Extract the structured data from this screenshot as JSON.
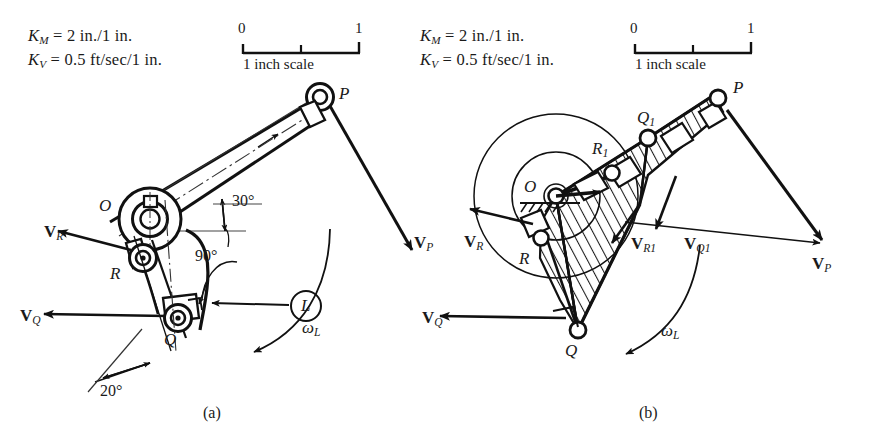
{
  "figure": {
    "caption_a": "(a)",
    "caption_b": "(b)"
  },
  "legend_a": {
    "km_sym": "K",
    "km_sub": "M",
    "km_value": "= 2 in./1 in.",
    "kv_sym": "K",
    "kv_sub": "V",
    "kv_value": "= 0.5 ft/sec/1 in."
  },
  "legend_b": {
    "km_sym": "K",
    "km_sub": "M",
    "km_value": "= 2 in./1 in.",
    "kv_sym": "K",
    "kv_sub": "V",
    "kv_value": "= 0.5 ft/sec/1 in."
  },
  "scale_a": {
    "left_tick": "0",
    "right_tick": "1",
    "caption": "1 inch scale"
  },
  "scale_b": {
    "left_tick": "0",
    "right_tick": "1",
    "caption": "1 inch scale"
  },
  "diagram_a": {
    "points": [
      {
        "name": "O",
        "label": "O"
      },
      {
        "name": "P",
        "label": "P"
      },
      {
        "name": "R",
        "label": "R"
      },
      {
        "name": "Q",
        "label": "Q"
      }
    ],
    "vectors": [
      {
        "name": "VR",
        "sym": "V",
        "sub": "R"
      },
      {
        "name": "VQ",
        "sym": "V",
        "sub": "Q"
      },
      {
        "name": "VP",
        "sym": "V",
        "sub": "P"
      }
    ],
    "angles": [
      {
        "name": "angle-30",
        "label": "30°"
      },
      {
        "name": "angle-90",
        "label": "90°"
      },
      {
        "name": "angle-20",
        "label": "20°"
      }
    ],
    "link_balloon": "L",
    "omega": {
      "sym": "ω",
      "sub": "L"
    }
  },
  "diagram_b": {
    "points": [
      {
        "name": "O",
        "label": "O"
      },
      {
        "name": "P",
        "label": "P"
      },
      {
        "name": "Q1",
        "label": "Q",
        "sub": "1"
      },
      {
        "name": "R1",
        "label": "R",
        "sub": "1"
      },
      {
        "name": "R",
        "label": "R"
      },
      {
        "name": "Q",
        "label": "Q"
      }
    ],
    "vectors": [
      {
        "name": "VR",
        "sym": "V",
        "sub": "R"
      },
      {
        "name": "VQ",
        "sym": "V",
        "sub": "Q"
      },
      {
        "name": "VR1",
        "sym": "V",
        "sub": "R",
        "sub2": "1"
      },
      {
        "name": "VQ1",
        "sym": "V",
        "sub": "Q",
        "sub2": "1"
      },
      {
        "name": "VP",
        "sym": "V",
        "sub": "P"
      }
    ],
    "omega": {
      "sym": "ω",
      "sub": "L"
    }
  },
  "colors": {
    "ink": "#111111",
    "paper": "#ffffff",
    "thin": "#2a2a2a"
  }
}
